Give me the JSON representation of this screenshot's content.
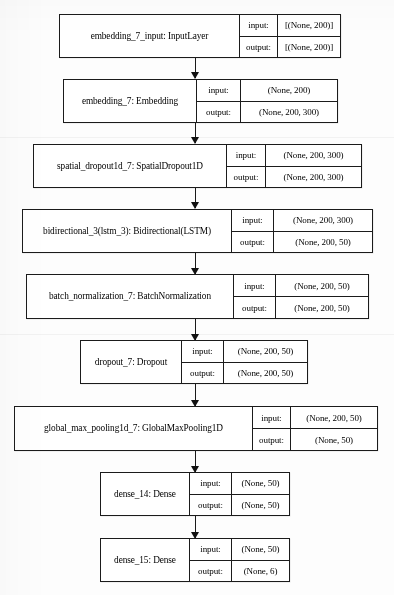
{
  "diagram": {
    "type": "neural-network-layer-graph",
    "orientation": "top-to-bottom",
    "io_labels": {
      "input": "input:",
      "output": "output:"
    },
    "layers": [
      {
        "id": "embedding_7_input",
        "name": "embedding_7_input: InputLayer",
        "input": "[(None, 200)]",
        "output": "[(None, 200)]"
      },
      {
        "id": "embedding_7",
        "name": "embedding_7: Embedding",
        "input": "(None, 200)",
        "output": "(None, 200, 300)"
      },
      {
        "id": "spatial_dropout1d_7",
        "name": "spatial_dropout1d_7: SpatialDropout1D",
        "input": "(None, 200, 300)",
        "output": "(None, 200, 300)"
      },
      {
        "id": "bidirectional_3",
        "name": "bidirectional_3(lstm_3): Bidirectional(LSTM)",
        "input": "(None, 200, 300)",
        "output": "(None, 200, 50)"
      },
      {
        "id": "batch_normalization_7",
        "name": "batch_normalization_7: BatchNormalization",
        "input": "(None, 200, 50)",
        "output": "(None, 200, 50)"
      },
      {
        "id": "dropout_7",
        "name": "dropout_7: Dropout",
        "input": "(None, 200, 50)",
        "output": "(None, 200, 50)"
      },
      {
        "id": "global_max_pooling1d_7",
        "name": "global_max_pooling1d_7: GlobalMaxPooling1D",
        "input": "(None, 200, 50)",
        "output": "(None, 50)"
      },
      {
        "id": "dense_14",
        "name": "dense_14: Dense",
        "input": "(None, 50)",
        "output": "(None, 50)"
      },
      {
        "id": "dense_15",
        "name": "dense_15: Dense",
        "input": "(None, 50)",
        "output": "(None, 6)"
      }
    ]
  },
  "style": {
    "border_color": "#1b1b1b",
    "background_color": "#ffffff",
    "text_color": "#000000"
  }
}
